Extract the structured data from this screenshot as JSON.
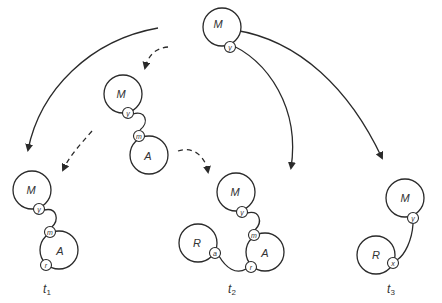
{
  "diagram": {
    "type": "state-transition",
    "top": {
      "node": "M",
      "port": "y"
    },
    "intermediate": {
      "nodes": [
        "M",
        "A"
      ],
      "ports": [
        "y",
        "m"
      ]
    },
    "states": [
      {
        "label": "t",
        "subscript": "1",
        "nodes": [
          "M",
          "A"
        ],
        "ports": [
          "y",
          "m",
          "r"
        ]
      },
      {
        "label": "t",
        "subscript": "2",
        "nodes": [
          "M",
          "A",
          "R"
        ],
        "ports": [
          "y",
          "m",
          "r",
          "a"
        ]
      },
      {
        "label": "t",
        "subscript": "3",
        "nodes": [
          "M",
          "R"
        ],
        "ports": [
          "y",
          "x"
        ]
      }
    ],
    "arrows": {
      "solid": [
        "top->t1",
        "top->t2",
        "top->t3"
      ],
      "dashed": [
        "top->intermediate",
        "intermediate->t1",
        "intermediate->t2"
      ]
    }
  }
}
